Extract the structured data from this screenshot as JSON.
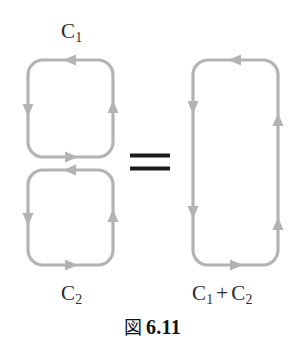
{
  "figure": {
    "caption_prefix": "図",
    "caption_number": "6.11",
    "caption_full": "図 6.11"
  },
  "colors": {
    "background": "#ffffff",
    "curve_stroke": "#b3b3b3",
    "arrow_fill": "#b3b3b3",
    "equals_sign": "#1a1a1a",
    "label_text": "#2b2b2b",
    "caption_text": "#111111"
  },
  "labels": {
    "c1": {
      "base": "C",
      "subscript": "1"
    },
    "c2": {
      "base": "C",
      "subscript": "2"
    },
    "sum": {
      "first_base": "C",
      "first_subscript": "1",
      "operator": "+",
      "second_base": "C",
      "second_subscript": "2"
    }
  },
  "relation": {
    "symbol": "="
  },
  "diagram": {
    "loops": [
      {
        "name": "contour-c1",
        "label": "C1",
        "shape": "rounded-square",
        "x": 28,
        "y": 60,
        "width": 85,
        "height": 97,
        "corner_radius": 15,
        "orientation": "counterclockwise",
        "arrow_count": 4,
        "arrow_directions": [
          "left",
          "down",
          "right",
          "up"
        ]
      },
      {
        "name": "contour-c2",
        "label": "C2",
        "shape": "rounded-square",
        "x": 28,
        "y": 170,
        "width": 85,
        "height": 95,
        "corner_radius": 15,
        "orientation": "counterclockwise",
        "arrow_count": 4,
        "arrow_directions": [
          "left",
          "down",
          "right",
          "up"
        ]
      },
      {
        "name": "contour-c1-plus-c2",
        "label": "C1 + C2",
        "shape": "rounded-rectangle",
        "x": 193,
        "y": 60,
        "width": 85,
        "height": 205,
        "corner_radius": 15,
        "orientation": "counterclockwise",
        "arrow_count": 6,
        "arrow_directions": [
          "left",
          "down",
          "down",
          "right",
          "up",
          "up"
        ]
      }
    ]
  }
}
